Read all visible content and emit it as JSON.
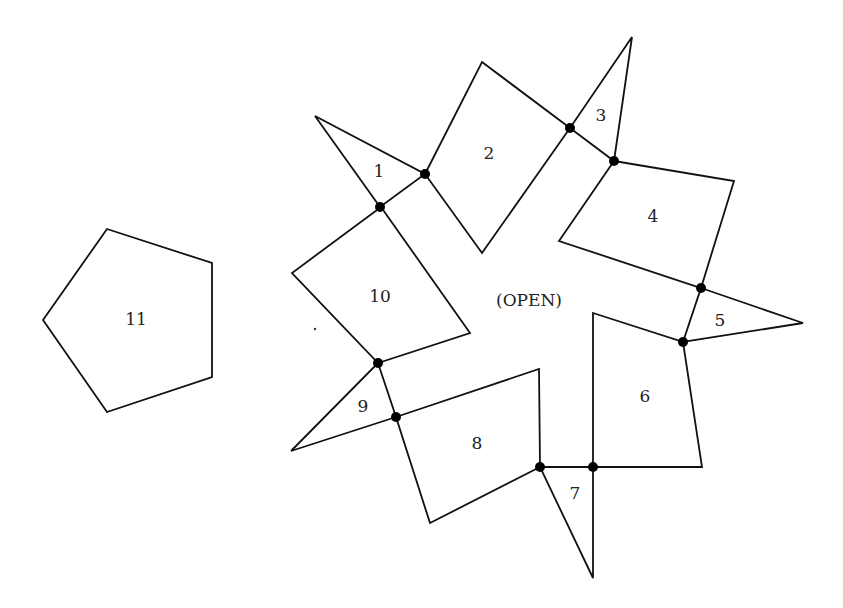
{
  "diagram": {
    "center_label": {
      "text": "(OPEN)",
      "x": 529,
      "y": 300
    },
    "pieces": [
      {
        "id": "1",
        "kind": "triangle",
        "points": [
          [
            315,
            116
          ],
          [
            425,
            174
          ],
          [
            380,
            207
          ]
        ],
        "label": {
          "text": "1",
          "x": 379,
          "y": 171
        }
      },
      {
        "id": "2",
        "kind": "quadrilateral",
        "points": [
          [
            482,
            62
          ],
          [
            570,
            128
          ],
          [
            482,
            253
          ],
          [
            425,
            174
          ]
        ],
        "label": {
          "text": "2",
          "x": 489,
          "y": 153
        }
      },
      {
        "id": "3",
        "kind": "triangle",
        "points": [
          [
            632,
            37
          ],
          [
            614,
            161
          ],
          [
            570,
            128
          ]
        ],
        "label": {
          "text": "3",
          "x": 601,
          "y": 115
        }
      },
      {
        "id": "4",
        "kind": "quadrilateral",
        "points": [
          [
            614,
            161
          ],
          [
            734,
            181
          ],
          [
            701,
            288
          ],
          [
            559,
            241
          ]
        ],
        "label": {
          "text": "4",
          "x": 653,
          "y": 216
        }
      },
      {
        "id": "5",
        "kind": "triangle",
        "points": [
          [
            701,
            288
          ],
          [
            803,
            323
          ],
          [
            683,
            342
          ]
        ],
        "label": {
          "text": "5",
          "x": 720,
          "y": 320
        }
      },
      {
        "id": "6",
        "kind": "quadrilateral",
        "points": [
          [
            593,
            313
          ],
          [
            683,
            342
          ],
          [
            702,
            467
          ],
          [
            593,
            467
          ]
        ],
        "label": {
          "text": "6",
          "x": 645,
          "y": 396
        }
      },
      {
        "id": "7",
        "kind": "triangle",
        "points": [
          [
            540,
            467
          ],
          [
            593,
            467
          ],
          [
            593,
            578
          ]
        ],
        "label": {
          "text": "7",
          "x": 575,
          "y": 493
        }
      },
      {
        "id": "8",
        "kind": "quadrilateral",
        "points": [
          [
            396,
            417
          ],
          [
            539,
            369
          ],
          [
            540,
            467
          ],
          [
            430,
            523
          ]
        ],
        "label": {
          "text": "8",
          "x": 477,
          "y": 443
        }
      },
      {
        "id": "9",
        "kind": "triangle",
        "points": [
          [
            378,
            363
          ],
          [
            396,
            417
          ],
          [
            291,
            451
          ]
        ],
        "label": {
          "text": "9",
          "x": 363,
          "y": 406
        }
      },
      {
        "id": "10",
        "kind": "quadrilateral",
        "points": [
          [
            381,
            207
          ],
          [
            470,
            333
          ],
          [
            378,
            363
          ],
          [
            292,
            273
          ]
        ],
        "label": {
          "text": "10",
          "x": 380,
          "y": 296
        }
      },
      {
        "id": "11",
        "kind": "pentagon",
        "points": [
          [
            107,
            229
          ],
          [
            212,
            263
          ],
          [
            212,
            377
          ],
          [
            107,
            412
          ],
          [
            43,
            320
          ]
        ],
        "label": {
          "text": "11",
          "x": 136,
          "y": 319
        }
      }
    ],
    "joints": [
      [
        425,
        174
      ],
      [
        380,
        207
      ],
      [
        570,
        128
      ],
      [
        614,
        161
      ],
      [
        701,
        288
      ],
      [
        683,
        342
      ],
      [
        593,
        467
      ],
      [
        540,
        467
      ],
      [
        396,
        417
      ],
      [
        378,
        363
      ]
    ],
    "speck": [
      315,
      329
    ],
    "colors": {
      "stroke": "#111111",
      "joint": "#000000",
      "text": "#222222",
      "background": "#ffffff"
    }
  }
}
